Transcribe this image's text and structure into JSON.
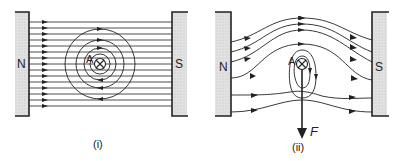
{
  "diagram": {
    "panels": [
      {
        "id": "i",
        "caption": "(i)",
        "left_pole": "N",
        "right_pole": "S",
        "conductor_label": "A",
        "conductor_symbol": "current-into-page",
        "description": "Uniform field lines N to S with concentric circular field around conductor"
      },
      {
        "id": "ii",
        "caption": "(ii)",
        "left_pole": "N",
        "right_pole": "S",
        "conductor_label": "A",
        "conductor_symbol": "current-into-page",
        "force_label": "F",
        "description": "Resultant catapult field; lines crowded above conductor, force F acts downward"
      }
    ],
    "colors": {
      "line": "#222222",
      "magnet_fill": "#d9d9d9",
      "background": "#ffffff"
    }
  }
}
